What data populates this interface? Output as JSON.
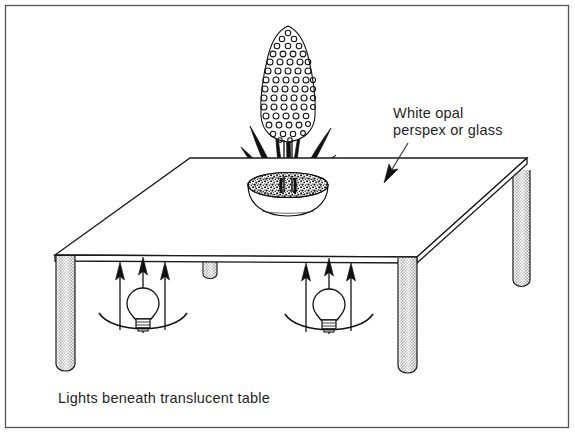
{
  "figure": {
    "kind": "technical-line-illustration",
    "background_color": "#ffffff",
    "ink_color": "#1a1a1a",
    "border_color": "#555555"
  },
  "annotations": {
    "material_label_line1": "White opal",
    "material_label_line2": "perspex or glass",
    "caption": "Lights beneath translucent table"
  },
  "scene": {
    "tabletop": {
      "material": "white opal perspex or glass",
      "shape": "square-slab-in-perspective",
      "slab_fill": "#ffffff",
      "edge_color": "#1a1a1a"
    },
    "legs": [
      {
        "name": "front-left-leg",
        "shading": "stipple",
        "fill": "#d8d8d8"
      },
      {
        "name": "front-right-leg",
        "shading": "stipple",
        "fill": "#d8d8d8"
      },
      {
        "name": "back-right-leg",
        "shading": "stipple",
        "fill": "#d8d8d8"
      },
      {
        "name": "back-left-leg-stub",
        "shading": "stipple",
        "fill": "#d8d8d8"
      }
    ],
    "lamps": [
      {
        "name": "lamp-left",
        "arrows": 3,
        "has_reflector": true
      },
      {
        "name": "lamp-right",
        "arrows": 3,
        "has_reflector": true
      }
    ],
    "plant": {
      "type": "hyacinth",
      "flower_spike": "dense conical floret cluster",
      "leaves": "long narrow strap leaves",
      "bowl": "shallow white bowl",
      "bowl_fill": "#ffffff",
      "gravel": "dark speckled gravel"
    }
  }
}
